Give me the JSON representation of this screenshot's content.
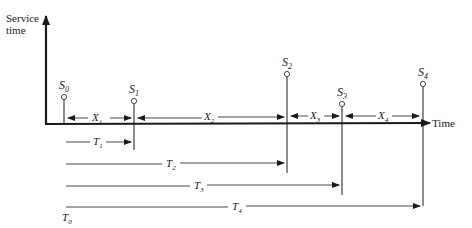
{
  "axes": {
    "y_label_line1": "Service",
    "y_label_line2": "time",
    "x_label": "Time"
  },
  "services": [
    {
      "name": "S",
      "sub": "0",
      "x": 64,
      "top": 97
    },
    {
      "name": "S",
      "sub": "1",
      "x": 134,
      "top": 101
    },
    {
      "name": "S",
      "sub": "2",
      "x": 287,
      "top": 74
    },
    {
      "name": "S",
      "sub": "3",
      "x": 342,
      "top": 104
    },
    {
      "name": "S",
      "sub": "4",
      "x": 423,
      "top": 84
    }
  ],
  "intervals": [
    {
      "name": "X",
      "sub": "1"
    },
    {
      "name": "X",
      "sub": "2"
    },
    {
      "name": "X",
      "sub": "3"
    },
    {
      "name": "X",
      "sub": "4"
    }
  ],
  "cumulative": [
    {
      "name": "T",
      "sub": "1"
    },
    {
      "name": "T",
      "sub": "2"
    },
    {
      "name": "T",
      "sub": "3"
    },
    {
      "name": "T",
      "sub": "4"
    }
  ],
  "origin": {
    "name": "T",
    "sub": "0"
  },
  "colors": {
    "ink": "#1a1a1a",
    "background": "#ffffff"
  }
}
